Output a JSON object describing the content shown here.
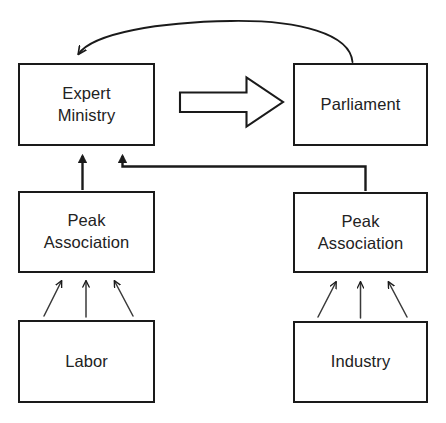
{
  "diagram": {
    "background_color": "#ffffff",
    "stroke_color": "#1a1a1a",
    "text_color": "#222222",
    "nodes": [
      {
        "id": "expert-ministry",
        "label": "Expert\nMinistry",
        "x": 18,
        "y": 63,
        "w": 137,
        "h": 83
      },
      {
        "id": "parliament",
        "label": "Parliament",
        "x": 293,
        "y": 63,
        "w": 135,
        "h": 83
      },
      {
        "id": "peak-left",
        "label": "Peak\nAssociation",
        "x": 18,
        "y": 191,
        "w": 137,
        "h": 82
      },
      {
        "id": "peak-right",
        "label": "Peak\nAssociation",
        "x": 293,
        "y": 192,
        "w": 135,
        "h": 81
      },
      {
        "id": "labor",
        "label": "Labor",
        "x": 18,
        "y": 320,
        "w": 137,
        "h": 83
      },
      {
        "id": "industry",
        "label": "Industry",
        "x": 293,
        "y": 321,
        "w": 135,
        "h": 82
      }
    ],
    "connectors": [
      {
        "id": "parliament-to-ministry-curve",
        "from": "parliament",
        "to": "expert-ministry",
        "style": "curved-thin-arrow"
      },
      {
        "id": "ministry-to-parliament-block",
        "from": "expert-ministry",
        "to": "parliament",
        "style": "hollow-block-arrow"
      },
      {
        "id": "peak-left-to-ministry",
        "from": "peak-left",
        "to": "expert-ministry",
        "style": "straight-thick-arrow"
      },
      {
        "id": "peak-right-to-ministry",
        "from": "peak-right",
        "to": "expert-ministry",
        "style": "elbow-thick-arrow"
      },
      {
        "id": "labor-to-peak-left-a",
        "from": "labor",
        "to": "peak-left",
        "style": "thin-arrow-diagonal-right"
      },
      {
        "id": "labor-to-peak-left-b",
        "from": "labor",
        "to": "peak-left",
        "style": "thin-arrow-vertical"
      },
      {
        "id": "labor-to-peak-left-c",
        "from": "labor",
        "to": "peak-left",
        "style": "thin-arrow-diagonal-left"
      },
      {
        "id": "industry-to-peak-right-a",
        "from": "industry",
        "to": "peak-right",
        "style": "thin-arrow-diagonal-right"
      },
      {
        "id": "industry-to-peak-right-b",
        "from": "industry",
        "to": "peak-right",
        "style": "thin-arrow-vertical"
      },
      {
        "id": "industry-to-peak-right-c",
        "from": "industry",
        "to": "peak-right",
        "style": "thin-arrow-diagonal-left"
      }
    ]
  }
}
